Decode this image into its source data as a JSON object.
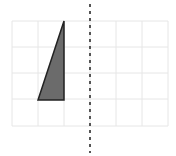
{
  "diagram": {
    "type": "reflection-grid",
    "grid": {
      "x_lines": [
        12,
        38,
        64,
        90,
        116,
        142,
        168
      ],
      "y_lines": [
        21,
        47,
        73,
        99,
        126
      ],
      "cell_size": 26,
      "columns": 6,
      "rows": 4,
      "line_color": "#e6e6e6"
    },
    "shape": {
      "kind": "right-triangle",
      "points": [
        [
          64,
          21
        ],
        [
          64,
          100
        ],
        [
          38,
          100
        ]
      ],
      "fill": "#6b6b6b",
      "stroke": "#222222",
      "grid_cells": {
        "width": 1,
        "height": 3
      }
    },
    "mirror_line": {
      "orientation": "vertical",
      "x": 90,
      "y_start": 4,
      "y_end": 153,
      "style": "dashed",
      "color": "#555555"
    }
  }
}
